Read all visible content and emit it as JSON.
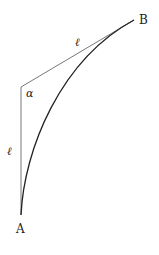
{
  "diagram": {
    "points": {
      "A": {
        "label": "A"
      },
      "B": {
        "label": "B"
      }
    },
    "segments": {
      "vertical": {
        "label": "ℓ"
      },
      "slanted": {
        "label": "ℓ"
      }
    },
    "angle": {
      "label": "α"
    },
    "colors": {
      "stroke": "#333333",
      "background": "#ffffff"
    }
  }
}
